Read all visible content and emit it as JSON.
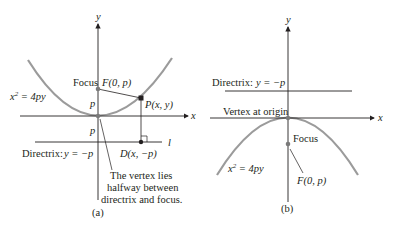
{
  "figure_a": {
    "caption": "(a)",
    "axis_y": "y",
    "axis_x": "x",
    "focus_word": "Focus",
    "focus_point": "F(0, p)",
    "equation": "x² = 4py",
    "equation_base": "x",
    "equation_exp": "2",
    "equation_rest": " = 4py",
    "point_p": "P(x, y)",
    "dist_upper": "p",
    "dist_lower": "p",
    "directrix_label": "Directrix:",
    "directrix_eq": "y = −p",
    "directrix_name": "l",
    "point_d": "D(x, −p)",
    "note_lines": [
      "The vertex lies",
      "halfway between",
      "directrix and focus."
    ]
  },
  "figure_b": {
    "caption": "(b)",
    "axis_y": "y",
    "axis_x": "x",
    "directrix_label": "Directrix:",
    "directrix_eq": "y = −p",
    "vertex_label": "Vertex at origin",
    "focus_word": "Focus",
    "focus_point": "F(0, p)",
    "equation_base": "x",
    "equation_exp": "2",
    "equation_rest": " = 4py"
  },
  "colors": {
    "curve": "#9b9b9b",
    "lines": "#231f20",
    "point": "#7a7a7a"
  }
}
